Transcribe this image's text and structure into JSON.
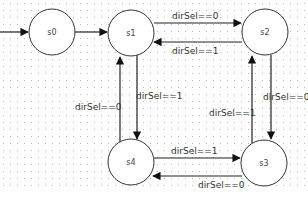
{
  "diagram": {
    "type": "state-machine",
    "states": [
      {
        "id": "s0",
        "label": "s0",
        "cx": 52,
        "cy": 32,
        "r": 23
      },
      {
        "id": "s1",
        "label": "s1",
        "cx": 131,
        "cy": 33,
        "r": 23
      },
      {
        "id": "s2",
        "label": "s2",
        "cx": 265,
        "cy": 32,
        "r": 23
      },
      {
        "id": "s3",
        "label": "s3",
        "cx": 264,
        "cy": 163,
        "r": 23
      },
      {
        "id": "s4",
        "label": "s4",
        "cx": 131,
        "cy": 162,
        "r": 23
      }
    ],
    "transitions": [
      {
        "id": "init-s0",
        "from": null,
        "to": "s0",
        "label": ""
      },
      {
        "id": "s0-s1",
        "from": "s0",
        "to": "s1",
        "label": ""
      },
      {
        "id": "s1-s2",
        "from": "s1",
        "to": "s2",
        "label": "dirSel==0"
      },
      {
        "id": "s2-s1",
        "from": "s2",
        "to": "s1",
        "label": "dirSel==1"
      },
      {
        "id": "s1-s4",
        "from": "s1",
        "to": "s4",
        "label": "dirSel==1"
      },
      {
        "id": "s4-s1",
        "from": "s4",
        "to": "s1",
        "label": "dirSel==0"
      },
      {
        "id": "s2-s3",
        "from": "s2",
        "to": "s3",
        "label": "dirSel==0"
      },
      {
        "id": "s3-s2",
        "from": "s3",
        "to": "s2",
        "label": "dirSel==1"
      },
      {
        "id": "s4-s3",
        "from": "s4",
        "to": "s3",
        "label": "dirSel==1"
      },
      {
        "id": "s3-s4",
        "from": "s3",
        "to": "s4",
        "label": "dirSel==0"
      }
    ]
  },
  "colors": {
    "background": "#ffffff",
    "grid_dot": "#b8b8b8",
    "stroke": "#222222",
    "text": "#333333"
  }
}
